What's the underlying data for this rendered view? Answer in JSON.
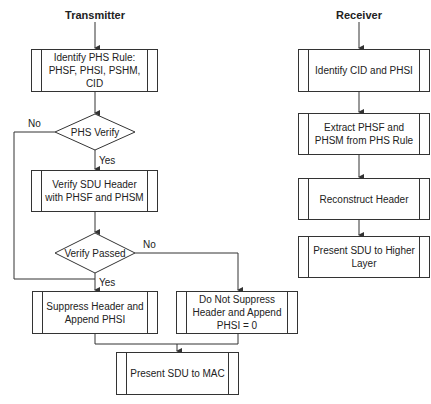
{
  "transmitter": {
    "title": "Transmitter",
    "identify_rule": "Identify PHS Rule: PHSF, PHSI, PSHM, CID",
    "phs_verify": "PHS Verify",
    "phs_verify_no": "No",
    "phs_verify_yes": "Yes",
    "verify_header": "Verify SDU Header with PHSF and PHSM",
    "verify_passed": "Verify Passed",
    "verify_passed_no": "No",
    "verify_passed_yes": "Yes",
    "suppress": "Suppress Header and Append PHSI",
    "not_suppress": "Do Not Suppress Header and Append PHSI = 0",
    "present_mac": "Present SDU to MAC"
  },
  "receiver": {
    "title": "Receiver",
    "identify": "Identify CID and PHSI",
    "extract": "Extract PHSF and PHSM from PHS Rule",
    "reconstruct": "Reconstruct Header",
    "present": "Present SDU to Higher Layer"
  },
  "colors": {
    "line": "#333333",
    "background": "#ffffff"
  }
}
